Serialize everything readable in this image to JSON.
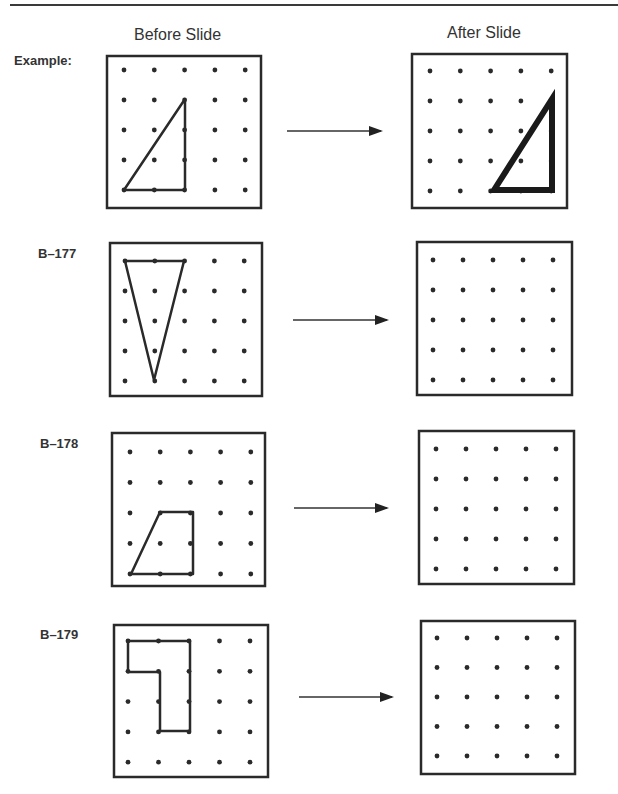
{
  "headers": {
    "before": "Before Slide",
    "after": "After Slide"
  },
  "rows": [
    {
      "label": "Example:",
      "before_shape": "right-triangle",
      "before_vertices": [
        [
          0,
          4
        ],
        [
          2,
          1
        ],
        [
          2,
          4
        ]
      ],
      "after_shape": "right-triangle (slid 2 right)",
      "after_vertices": [
        [
          2,
          4
        ],
        [
          4,
          1
        ],
        [
          4,
          4
        ]
      ]
    },
    {
      "label": "B–177",
      "before_shape": "inverted-triangle",
      "before_vertices": [
        [
          0,
          0
        ],
        [
          2,
          0
        ],
        [
          1,
          4
        ]
      ],
      "after_shape": "blank"
    },
    {
      "label": "B–178",
      "before_shape": "trapezoid",
      "before_vertices": [
        [
          1,
          2
        ],
        [
          2,
          2
        ],
        [
          2,
          4
        ],
        [
          0,
          4
        ]
      ],
      "after_shape": "blank"
    },
    {
      "label": "B–179",
      "before_shape": "L-shape",
      "before_vertices": [
        [
          0,
          0
        ],
        [
          2,
          0
        ],
        [
          2,
          3
        ],
        [
          1,
          3
        ],
        [
          1,
          1
        ],
        [
          0,
          1
        ]
      ],
      "after_shape": "blank"
    }
  ],
  "grid": {
    "columns": 5,
    "rows": 5
  },
  "arrow_icon": "right-arrow-icon"
}
